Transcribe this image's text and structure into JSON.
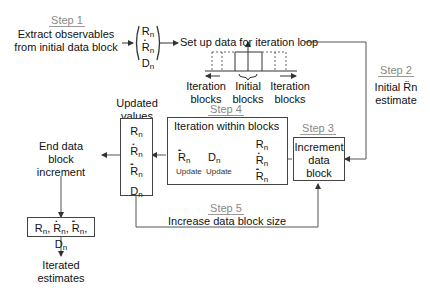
{
  "steps": {
    "step1": {
      "label": "Step 1",
      "text": [
        "Extract observables",
        "from initial data block"
      ]
    },
    "step2": {
      "label": "Step 2",
      "text": [
        "Initial R̈n",
        "estimate"
      ]
    },
    "step3": {
      "label": "Step 3",
      "text": [
        "Increment",
        "data",
        "block"
      ]
    },
    "step4": {
      "label": "Step 4",
      "title": "Iteration within blocks"
    },
    "step5": {
      "label": "Step 5",
      "text": "Increase data block size"
    }
  },
  "setup_text": "Set up data for iteration loop",
  "block_labels": {
    "left": [
      "Iteration",
      "blocks"
    ],
    "center": [
      "Initial",
      "blocks"
    ],
    "right": [
      "Iteration",
      "blocks"
    ]
  },
  "updated_values": {
    "title": [
      "Updated",
      "values"
    ]
  },
  "end_text": [
    "End data",
    "block",
    "increment"
  ],
  "final_box": "R_n, Ṙ_n, R̈_n, D_n",
  "final_text": [
    "Iterated",
    "estimates"
  ],
  "variables": {
    "R": "R",
    "D": "D",
    "sub": "n"
  },
  "update_label": "Update"
}
